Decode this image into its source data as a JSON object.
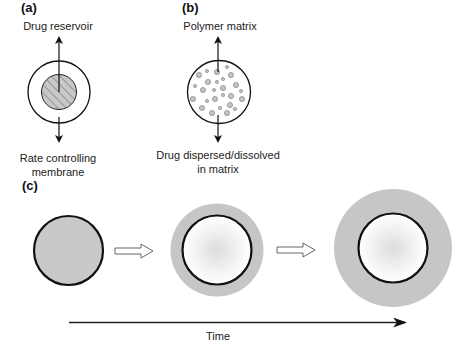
{
  "panels": {
    "a": {
      "tag": "(a)",
      "top_label": "Drug reservoir",
      "bottom_label_line1": "Rate controlling",
      "bottom_label_line2": "membrane"
    },
    "b": {
      "tag": "(b)",
      "top_label": "Polymer matrix",
      "bottom_label_line1": "Drug dispersed/dissolved",
      "bottom_label_line2": "in matrix"
    },
    "c": {
      "tag": "(c)",
      "axis_label": "Time",
      "stages": [
        {
          "name": "initial",
          "halo_radius": 0,
          "core_radius": 35
        },
        {
          "name": "swelling",
          "halo_radius": 46,
          "core_radius": 35
        },
        {
          "name": "swollen",
          "halo_radius": 59,
          "core_radius": 35
        }
      ]
    }
  },
  "colors": {
    "stroke": "#111111",
    "reservoir_fill": "#c8c8c8",
    "particle_fill": "#c4c4c4",
    "halo_fill": "#c6c6c6",
    "core_center": "#dedede",
    "background": "#ffffff"
  }
}
